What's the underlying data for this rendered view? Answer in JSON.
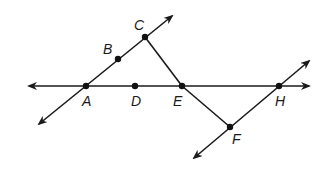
{
  "diagram": {
    "background": "#ffffff",
    "stroke_color": "#1a1a1a",
    "points": {
      "A": {
        "label": "A",
        "x": 86,
        "y": 86
      },
      "B": {
        "label": "B",
        "x": 118,
        "y": 59
      },
      "C": {
        "label": "C",
        "x": 145,
        "y": 37
      },
      "D": {
        "label": "D",
        "x": 135,
        "y": 86
      },
      "E": {
        "label": "E",
        "x": 182,
        "y": 86
      },
      "F": {
        "label": "F",
        "x": 230,
        "y": 127
      },
      "H": {
        "label": "H",
        "x": 279,
        "y": 86
      }
    },
    "lines": [
      {
        "name": "line-ADEH",
        "type": "line",
        "through": [
          "A",
          "D",
          "E",
          "H"
        ],
        "arrows": "both"
      },
      {
        "name": "line-ABC",
        "type": "line",
        "through": [
          "A",
          "B",
          "C"
        ],
        "arrows": "both"
      },
      {
        "name": "line-FH",
        "type": "line",
        "through": [
          "F",
          "H"
        ],
        "arrows": "both"
      },
      {
        "name": "segment-CE",
        "type": "segment",
        "through": [
          "C",
          "E"
        ],
        "arrows": "none"
      },
      {
        "name": "segment-EF",
        "type": "segment",
        "through": [
          "E",
          "F"
        ],
        "arrows": "none"
      }
    ]
  }
}
